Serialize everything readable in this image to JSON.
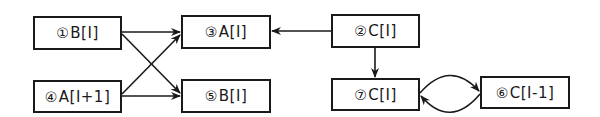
{
  "diagram": {
    "type": "dependence-graph",
    "colors": {
      "line": "#1a1a1a",
      "background": "#ffffff"
    },
    "nodes": [
      {
        "id": "n1",
        "num": "①",
        "label": "B[I]"
      },
      {
        "id": "n3",
        "num": "③",
        "label": "A[I]"
      },
      {
        "id": "n2",
        "num": "②",
        "label": "C[I]"
      },
      {
        "id": "n4",
        "num": "④",
        "label": "A[I+1]"
      },
      {
        "id": "n5",
        "num": "⑤",
        "label": "B[I]"
      },
      {
        "id": "n7",
        "num": "⑦",
        "label": "C[I]"
      },
      {
        "id": "n6",
        "num": "⑥",
        "label": "C[I-1]"
      }
    ],
    "edges": [
      {
        "from": "n1",
        "to": "n3"
      },
      {
        "from": "n1",
        "to": "n5"
      },
      {
        "from": "n4",
        "to": "n3"
      },
      {
        "from": "n4",
        "to": "n5"
      },
      {
        "from": "n2",
        "to": "n3"
      },
      {
        "from": "n2",
        "to": "n7"
      },
      {
        "from": "n7",
        "to": "n6"
      },
      {
        "from": "n6",
        "to": "n7"
      }
    ]
  }
}
